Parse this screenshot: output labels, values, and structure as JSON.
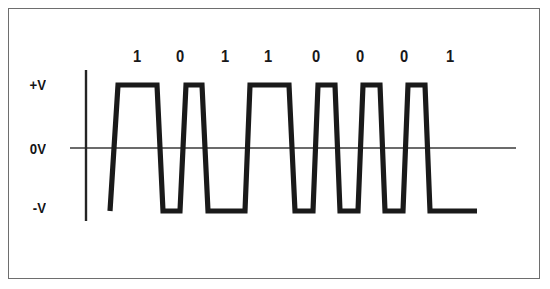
{
  "figure": {
    "name": "digital-signal-waveform-diagram",
    "background_color": "#ffffff",
    "frame_color": "#6e6e6e",
    "trace_color": "#1a1a1a",
    "axis_color": "#3a3a3a"
  },
  "axis": {
    "y_labels": [
      {
        "id": "plus-v",
        "text": "+V",
        "x": 46,
        "y": 77
      },
      {
        "id": "zero-v",
        "text": "0V",
        "x": 46,
        "y": 142
      },
      {
        "id": "minus-v",
        "text": "-V",
        "x": 46,
        "y": 200
      }
    ],
    "vertical_axis": {
      "x": 86,
      "y_top": 70,
      "y_bottom": 221
    },
    "zero_line": {
      "y": 148,
      "x_start": 70,
      "x_end": 516
    }
  },
  "levels": {
    "plus_v_y": 85,
    "zero_v_y": 148,
    "minus_v_y": 211
  },
  "bits": [
    {
      "index": 0,
      "value": "1",
      "label_x": 137,
      "label_y": 50
    },
    {
      "index": 1,
      "value": "0",
      "label_x": 180,
      "label_y": 50
    },
    {
      "index": 2,
      "value": "1",
      "label_x": 225,
      "label_y": 50
    },
    {
      "index": 3,
      "value": "1",
      "label_x": 268,
      "label_y": 50
    },
    {
      "index": 4,
      "value": "0",
      "label_x": 316,
      "label_y": 50
    },
    {
      "index": 5,
      "value": "0",
      "label_x": 360,
      "label_y": 50
    },
    {
      "index": 6,
      "value": "0",
      "label_x": 404,
      "label_y": 50
    },
    {
      "index": 7,
      "value": "1",
      "label_x": 450,
      "label_y": 50
    }
  ],
  "chart_data": {
    "type": "line",
    "title": "",
    "xlabel": "",
    "ylabel": "",
    "bit_sequence": [
      "1",
      "0",
      "1",
      "1",
      "0",
      "0",
      "0",
      "1"
    ],
    "y_tick_labels": [
      "+V",
      "0V",
      "-V"
    ],
    "y_tick_values": [
      1,
      0,
      -1
    ],
    "grid": false,
    "legend": null,
    "trace_points": [
      [
        110,
        -1
      ],
      [
        118,
        1
      ],
      [
        157,
        1
      ],
      [
        163,
        -1
      ],
      [
        180,
        -1
      ],
      [
        186,
        1
      ],
      [
        202,
        1
      ],
      [
        208,
        -1
      ],
      [
        245,
        -1
      ],
      [
        250,
        1
      ],
      [
        289,
        1
      ],
      [
        295,
        -1
      ],
      [
        313,
        -1
      ],
      [
        318,
        1
      ],
      [
        335,
        1
      ],
      [
        340,
        -1
      ],
      [
        358,
        -1
      ],
      [
        363,
        1
      ],
      [
        380,
        1
      ],
      [
        385,
        -1
      ],
      [
        403,
        -1
      ],
      [
        408,
        1
      ],
      [
        425,
        1
      ],
      [
        430,
        -1
      ],
      [
        477,
        -1
      ]
    ]
  }
}
